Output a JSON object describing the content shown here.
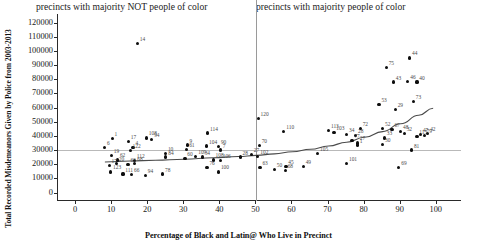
{
  "chart_data": {
    "type": "scatter",
    "title": "",
    "xlabel": "Percentage of Black and Latin@ Who Live in Precinct",
    "ylabel": "Total Recorded Misdemeanors Given by Police from 2003-2013",
    "xlim": [
      -5,
      107
    ],
    "ylim": [
      -6000,
      126000
    ],
    "xticks": [
      0,
      10,
      20,
      30,
      40,
      50,
      60,
      70,
      80,
      90,
      100
    ],
    "yticks": [
      0,
      10000,
      20000,
      30000,
      40000,
      50000,
      60000,
      70000,
      80000,
      90000,
      100000,
      110000,
      120000
    ],
    "grid": "horizontal gridline at y=30000",
    "legend": "none",
    "annotations": {
      "left_panel_caption": "precincts with majority NOT people of color",
      "right_panel_caption": "precincts with majority people of color",
      "vertical_divider_x": 50,
      "horizontal_gridline_y": 30000
    },
    "point_label_meaning": "NYPD precinct number",
    "points": [
      {
        "label": "14",
        "x": 17.0,
        "y": 105000
      },
      {
        "label": "114",
        "x": 36.5,
        "y": 42000
      },
      {
        "label": "108",
        "x": 19.5,
        "y": 38500
      },
      {
        "label": "94",
        "x": 21.0,
        "y": 37500
      },
      {
        "label": "1",
        "x": 10.0,
        "y": 38000
      },
      {
        "label": "17",
        "x": 14.5,
        "y": 36000
      },
      {
        "label": "6",
        "x": 7.9,
        "y": 32000
      },
      {
        "label": "9",
        "x": 30.8,
        "y": 33500
      },
      {
        "label": "104",
        "x": 36.2,
        "y": 32800
      },
      {
        "label": "90",
        "x": 39.5,
        "y": 32500
      },
      {
        "label": "4",
        "x": 15.8,
        "y": 32000
      },
      {
        "label": "19",
        "x": 9.8,
        "y": 26000
      },
      {
        "label": "122",
        "x": 15.0,
        "y": 29500
      },
      {
        "label": "10",
        "x": 24.8,
        "y": 27500
      },
      {
        "label": "84",
        "x": 24.9,
        "y": 25000
      },
      {
        "label": "61",
        "x": 30.7,
        "y": 30500
      },
      {
        "label": "7",
        "x": 40.0,
        "y": 30000
      },
      {
        "label": "109",
        "x": 33.2,
        "y": 25500
      },
      {
        "label": "34",
        "x": 35.0,
        "y": 25000
      },
      {
        "label": "60",
        "x": 30.2,
        "y": 24200
      },
      {
        "label": "62",
        "x": 11.5,
        "y": 23000
      },
      {
        "label": "20",
        "x": 11.2,
        "y": 20500
      },
      {
        "label": "112",
        "x": 16.2,
        "y": 22500
      },
      {
        "label": "68",
        "x": 16.3,
        "y": 20500
      },
      {
        "label": "63",
        "x": 14.4,
        "y": 20000
      },
      {
        "label": "17b",
        "x": 9.2,
        "y": 19000
      },
      {
        "label": "123",
        "x": 9.6,
        "y": 14500
      },
      {
        "label": "111",
        "x": 13.0,
        "y": 13000
      },
      {
        "label": "66",
        "x": 15.4,
        "y": 12500
      },
      {
        "label": "94b",
        "x": 19.2,
        "y": 12000
      },
      {
        "label": "78",
        "x": 24.0,
        "y": 13000
      },
      {
        "label": "108b",
        "x": 38.0,
        "y": 23000
      },
      {
        "label": "106",
        "x": 40.0,
        "y": 22500
      },
      {
        "label": "76",
        "x": 36.3,
        "y": 17500
      },
      {
        "label": "100",
        "x": 39.5,
        "y": 14500
      },
      {
        "label": "120",
        "x": 50.5,
        "y": 52500
      },
      {
        "label": "110",
        "x": 57.6,
        "y": 43000
      },
      {
        "label": "70",
        "x": 50.8,
        "y": 33000
      },
      {
        "label": "27",
        "x": 48.6,
        "y": 27000
      },
      {
        "label": "102",
        "x": 50.4,
        "y": 25500
      },
      {
        "label": "28",
        "x": 45.5,
        "y": 25000
      },
      {
        "label": "105",
        "x": 67.0,
        "y": 27500
      },
      {
        "label": "63b",
        "x": 51.0,
        "y": 17500
      },
      {
        "label": "50",
        "x": 55.0,
        "y": 16500
      },
      {
        "label": "68b",
        "x": 58.0,
        "y": 15500
      },
      {
        "label": "45",
        "x": 58.2,
        "y": 18500
      },
      {
        "label": "49",
        "x": 63.0,
        "y": 18500
      },
      {
        "label": "113",
        "x": 70.0,
        "y": 44000
      },
      {
        "label": "103",
        "x": 71.5,
        "y": 42500
      },
      {
        "label": "34b",
        "x": 75.0,
        "y": 41000
      },
      {
        "label": "28b",
        "x": 77.5,
        "y": 40000
      },
      {
        "label": "72",
        "x": 78.8,
        "y": 45000
      },
      {
        "label": "77",
        "x": 76.5,
        "y": 36500
      },
      {
        "label": "27b",
        "x": 78.0,
        "y": 35000
      },
      {
        "label": "1b",
        "x": 78.0,
        "y": 33500
      },
      {
        "label": "101",
        "x": 75.0,
        "y": 20500
      },
      {
        "label": "53",
        "x": 84.0,
        "y": 62000
      },
      {
        "label": "75",
        "x": 86.0,
        "y": 88000
      },
      {
        "label": "44",
        "x": 92.5,
        "y": 95000
      },
      {
        "label": "43",
        "x": 88.0,
        "y": 78000
      },
      {
        "label": "46",
        "x": 92.0,
        "y": 78500
      },
      {
        "label": "40",
        "x": 94.5,
        "y": 78000
      },
      {
        "label": "73",
        "x": 93.5,
        "y": 64000
      },
      {
        "label": "29",
        "x": 88.5,
        "y": 58500
      },
      {
        "label": "52",
        "x": 85.0,
        "y": 45000
      },
      {
        "label": "67",
        "x": 87.6,
        "y": 44500
      },
      {
        "label": "48",
        "x": 90.0,
        "y": 43000
      },
      {
        "label": "32",
        "x": 91.0,
        "y": 41500
      },
      {
        "label": "33",
        "x": 85.5,
        "y": 38500
      },
      {
        "label": "30",
        "x": 85.0,
        "y": 34000
      },
      {
        "label": "115",
        "x": 94.5,
        "y": 39500
      },
      {
        "label": "47",
        "x": 95.5,
        "y": 41000
      },
      {
        "label": "42",
        "x": 97.5,
        "y": 41500
      },
      {
        "label": "79",
        "x": 96.5,
        "y": 40000
      },
      {
        "label": "81",
        "x": 93.0,
        "y": 30000
      },
      {
        "label": "69",
        "x": 89.5,
        "y": 17500
      }
    ],
    "trend_line": {
      "style": "smoothed loess curve",
      "points": [
        {
          "x": 8,
          "y": 21500
        },
        {
          "x": 15,
          "y": 22200
        },
        {
          "x": 22,
          "y": 22800
        },
        {
          "x": 30,
          "y": 23500
        },
        {
          "x": 38,
          "y": 24500
        },
        {
          "x": 45,
          "y": 25400
        },
        {
          "x": 50,
          "y": 26200
        },
        {
          "x": 55,
          "y": 27300
        },
        {
          "x": 60,
          "y": 28800
        },
        {
          "x": 65,
          "y": 30500
        },
        {
          "x": 70,
          "y": 32800
        },
        {
          "x": 75,
          "y": 35500
        },
        {
          "x": 80,
          "y": 39000
        },
        {
          "x": 85,
          "y": 43000
        },
        {
          "x": 90,
          "y": 48500
        },
        {
          "x": 95,
          "y": 54500
        },
        {
          "x": 99,
          "y": 59500
        }
      ]
    }
  }
}
